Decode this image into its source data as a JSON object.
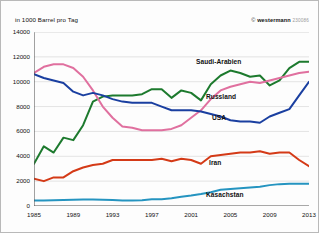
{
  "header": {
    "unit_label": "in 1000 Barrel pro Tag",
    "copyright_symbol": "©",
    "brand": "westermann",
    "code": "230086"
  },
  "chart_data": {
    "type": "line",
    "title": "",
    "subtitle": "",
    "xlabel": "",
    "ylabel": "in 1000 Barrel pro Tag",
    "grid": true,
    "legend_position": "inline-annotations",
    "xlim": [
      1985,
      2013
    ],
    "ylim": [
      0,
      14000
    ],
    "ytick_labels": [
      "0",
      "2000",
      "4000",
      "6000",
      "8000",
      "10000",
      "12000",
      "14000"
    ],
    "yticks": [
      0,
      2000,
      4000,
      6000,
      8000,
      10000,
      12000,
      14000
    ],
    "xtick_labels": [
      "1985",
      "1989",
      "1993",
      "1997",
      "2001",
      "2005",
      "2009",
      "2013"
    ],
    "xticks": [
      1985,
      1989,
      1993,
      1997,
      2001,
      2005,
      2009,
      2013
    ],
    "x": [
      1985,
      1986,
      1987,
      1988,
      1989,
      1990,
      1991,
      1992,
      1993,
      1994,
      1995,
      1996,
      1997,
      1998,
      1999,
      2000,
      2001,
      2002,
      2003,
      2004,
      2005,
      2006,
      2007,
      2008,
      2009,
      2010,
      2011,
      2012,
      2013
    ],
    "series": [
      {
        "name": "Saudi-Arabien",
        "color": "#1d7a2e",
        "values": [
          3400,
          4800,
          4300,
          5500,
          5300,
          6500,
          8400,
          8800,
          8900,
          8900,
          8900,
          9000,
          9400,
          9400,
          8700,
          9300,
          9100,
          8500,
          9800,
          10500,
          10900,
          10700,
          10400,
          10500,
          9700,
          10100,
          11100,
          11600,
          11600
        ]
      },
      {
        "name": "Russland",
        "color": "#e0709f",
        "values": [
          10700,
          11200,
          11400,
          11400,
          11100,
          10400,
          9300,
          8000,
          7100,
          6400,
          6300,
          6100,
          6100,
          6100,
          6200,
          6500,
          7100,
          7700,
          8600,
          9300,
          9600,
          9800,
          10000,
          9900,
          10100,
          10300,
          10500,
          10700,
          10800
        ]
      },
      {
        "name": "USA",
        "color": "#1a3fa0",
        "values": [
          10600,
          10300,
          10100,
          9900,
          9200,
          8900,
          9100,
          8900,
          8600,
          8400,
          8300,
          8300,
          8300,
          8000,
          7700,
          7700,
          7700,
          7600,
          7400,
          7200,
          6900,
          6800,
          6800,
          6700,
          7200,
          7500,
          7800,
          8900,
          10000
        ]
      },
      {
        "name": "Iran",
        "color": "#d43a17",
        "values": [
          2200,
          2000,
          2300,
          2300,
          2800,
          3100,
          3300,
          3400,
          3700,
          3700,
          3700,
          3700,
          3700,
          3800,
          3600,
          3800,
          3700,
          3400,
          4000,
          4100,
          4200,
          4300,
          4300,
          4400,
          4200,
          4300,
          4300,
          3700,
          3200
        ]
      },
      {
        "name": "Kasachstan",
        "color": "#2594c0",
        "values": [
          450,
          450,
          470,
          480,
          500,
          520,
          530,
          500,
          480,
          450,
          440,
          470,
          540,
          540,
          630,
          740,
          840,
          960,
          1110,
          1300,
          1360,
          1420,
          1490,
          1550,
          1680,
          1760,
          1790,
          1790,
          1800
        ]
      }
    ],
    "annotations": [
      {
        "label": "Saudi-Arabien",
        "x_px": 195,
        "y_px": 57
      },
      {
        "label": "Russland",
        "x_px": 205,
        "y_px": 92
      },
      {
        "label": "USA",
        "x_px": 211,
        "y_px": 113
      },
      {
        "label": "Iran",
        "x_px": 208,
        "y_px": 158
      },
      {
        "label": "Kasachstan",
        "x_px": 205,
        "y_px": 190
      }
    ]
  }
}
